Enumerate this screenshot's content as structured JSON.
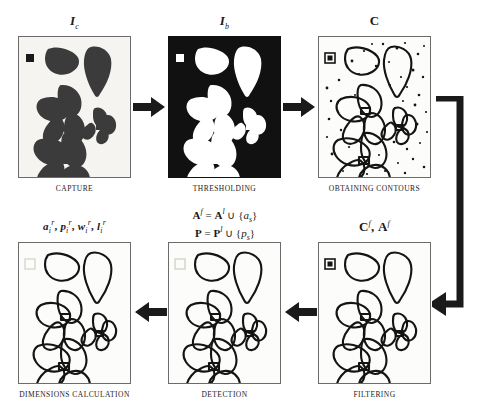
{
  "figure": {
    "colors": {
      "ink": "#1a1a1a",
      "frame_border": "#6b6b6b",
      "panel_paper": "#f7f6f2",
      "binary_background": "#111111",
      "binary_foreground": "#ffffff",
      "contour_stroke": "#1a1a1a",
      "leaf_fill": "#3a3a3a"
    },
    "layout": {
      "rows": 2,
      "columns": 3,
      "flow": "left-to-right on top row, wraps down the right side, then right-to-left on bottom row"
    }
  },
  "panels": [
    {
      "id": "capture",
      "row": 1,
      "column": 1,
      "top_label": "I",
      "top_label_sub": "c",
      "caption": "CAPTURE",
      "content_kind": "grayscale-photo",
      "has_calibration_square": true,
      "calibration_square_style": "filled-black",
      "leaf_count": 5,
      "noise_speckles": 0
    },
    {
      "id": "thresholding",
      "row": 1,
      "column": 2,
      "top_label": "I",
      "top_label_sub": "b",
      "caption": "THRESHOLDING",
      "content_kind": "binary-image",
      "has_calibration_square": true,
      "calibration_square_style": "filled-white",
      "leaf_count": 5,
      "noise_speckles": 0
    },
    {
      "id": "obtaining-contours",
      "row": 1,
      "column": 3,
      "top_label": "C",
      "top_label_sub": "",
      "caption": "OBTAINING CONTOURS",
      "content_kind": "contours",
      "has_calibration_square": true,
      "calibration_square_style": "outline",
      "leaf_count": 5,
      "noise_speckles": 42
    },
    {
      "id": "filtering",
      "row": 2,
      "column": 3,
      "top_label": "C",
      "top_label_sup": "f",
      "top_label_2": "A",
      "top_label_2_sup": "f",
      "caption": "FILTERING",
      "content_kind": "contours",
      "has_calibration_square": true,
      "calibration_square_style": "outline",
      "leaf_count": 5,
      "noise_speckles": 0
    },
    {
      "id": "detection",
      "row": 2,
      "column": 2,
      "top_label": "",
      "caption": "DETECTION",
      "content_kind": "contours",
      "has_calibration_square": true,
      "calibration_square_style": "faint-outline",
      "leaf_count": 5,
      "noise_speckles": 0
    },
    {
      "id": "dimensions-calculation",
      "row": 2,
      "column": 1,
      "top_label": "",
      "caption": "DIMENSIONS CALCULATION",
      "content_kind": "contours",
      "has_calibration_square": true,
      "calibration_square_style": "faint-outline",
      "leaf_count": 5,
      "noise_speckles": 0
    }
  ],
  "labels": {
    "capture_symbol": {
      "base": "I",
      "sub": "c"
    },
    "thresholding_symbol": {
      "base": "I",
      "sub": "b"
    },
    "contours_symbol": {
      "base": "C"
    },
    "filtering_symbol": {
      "parts": [
        {
          "base": "C",
          "sup": "f"
        },
        {
          "sep": ", "
        },
        {
          "base": "A",
          "sup": "f"
        }
      ]
    },
    "dimensions_symbol": {
      "text": "a, p, w, l with subscript i and superscript r",
      "parts": [
        {
          "base": "a",
          "sub": "i",
          "sup": "r"
        },
        {
          "base": "p",
          "sub": "i",
          "sup": "r"
        },
        {
          "base": "w",
          "sub": "i",
          "sup": "r"
        },
        {
          "base": "l",
          "sub": "i",
          "sup": "r"
        }
      ]
    }
  },
  "formula": {
    "line1": {
      "lhs_base": "A",
      "lhs_sup": "f",
      "eq": "=",
      "rhs_base": "A",
      "rhs_sup": "l",
      "op": "∪",
      "set_open": "{",
      "set_var": "a",
      "set_sub": "s",
      "set_close": "}"
    },
    "line2": {
      "lhs_base": "P",
      "lhs_sup": "",
      "eq": "=",
      "rhs_base": "P",
      "rhs_sup": "l",
      "op": "∪",
      "set_open": "{",
      "set_var": "p",
      "set_sub": "s",
      "set_close": "}"
    },
    "plain_line1": "A^f = A^l ∪ {a_s}",
    "plain_line2": "P = P^l ∪ {p_s}"
  },
  "captions": {
    "capture": "CAPTURE",
    "thresholding": "THRESHOLDING",
    "obtaining_contours": "OBTAINING CONTOURS",
    "filtering": "FILTERING",
    "detection": "DETECTION",
    "dimensions_calculation": "DIMENSIONS CALCULATION"
  },
  "arrows": [
    {
      "id": "arrow-capture-to-thresholding",
      "direction": "right"
    },
    {
      "id": "arrow-thresholding-to-contours",
      "direction": "right"
    },
    {
      "id": "arrow-contours-to-filtering",
      "direction": "wrap-right-down-left"
    },
    {
      "id": "arrow-filtering-to-detection",
      "direction": "left"
    },
    {
      "id": "arrow-detection-to-dimensions",
      "direction": "left"
    }
  ]
}
